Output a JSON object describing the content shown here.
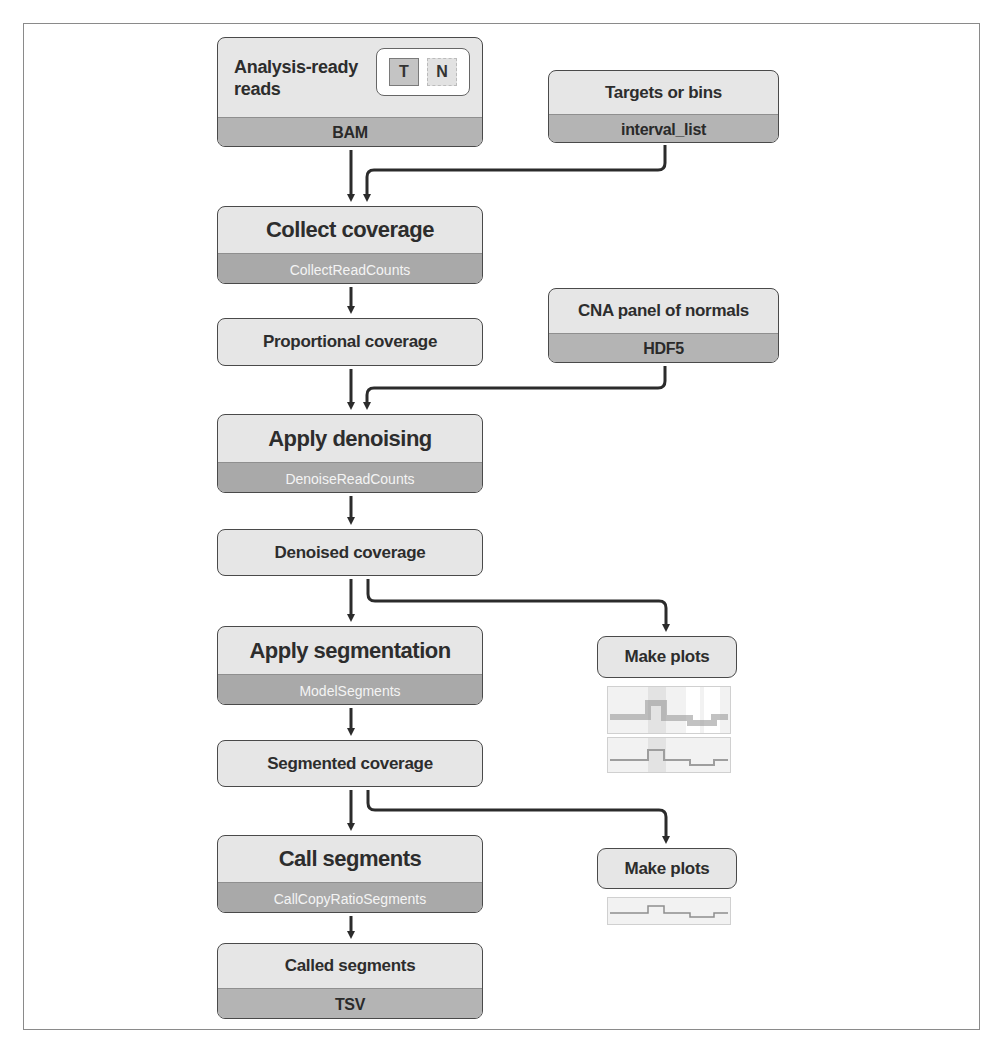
{
  "diagram": {
    "inputs": {
      "reads": {
        "title_line1": "Analysis-ready",
        "title_line2": "reads",
        "format": "BAM",
        "tumor_label": "T",
        "normal_label": "N"
      },
      "intervals": {
        "title": "Targets or bins",
        "format": "interval_list"
      },
      "pon": {
        "title": "CNA panel of normals",
        "format": "HDF5"
      }
    },
    "steps": [
      {
        "title": "Collect coverage",
        "tool": "CollectReadCounts"
      },
      {
        "title": "Apply denoising",
        "tool": "DenoiseReadCounts"
      },
      {
        "title": "Apply segmentation",
        "tool": "ModelSegments"
      },
      {
        "title": "Call segments",
        "tool": "CallCopyRatioSegments"
      }
    ],
    "intermediates": [
      {
        "title": "Proportional coverage"
      },
      {
        "title": "Denoised coverage"
      },
      {
        "title": "Segmented coverage"
      }
    ],
    "output": {
      "title": "Called segments",
      "format": "TSV"
    },
    "side_outputs": [
      {
        "title": "Make plots",
        "thumbnails": 2
      },
      {
        "title": "Make plots",
        "thumbnails": 1
      }
    ],
    "colors": {
      "box_fill": "#e6e6e6",
      "format_band": "#b4b4b4",
      "tool_band": "#a9a9a9",
      "stroke": "#2b2b2b"
    }
  }
}
